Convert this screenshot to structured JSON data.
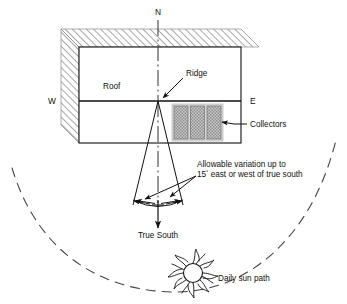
{
  "figure": {
    "labels": {
      "north": "N",
      "west": "W",
      "east": "E",
      "roof": "Roof",
      "ridge": "Ridge",
      "collectors": "Collectors",
      "true_south": "True South",
      "daily_sun_path": "Daily sun path",
      "variation_line1": "Allowable variation up to",
      "variation_line2_value": "15",
      "variation_line2_degree": "°",
      "variation_line2_rest": " east or west of true south"
    },
    "colors": {
      "ink": "#111111",
      "hatch": "#8a8a8a",
      "collector_fill": "#a8a8a8",
      "collector_border": "#d8d8d8",
      "background": "#ffffff"
    },
    "geometry": {
      "allowable_variation_degrees": 15,
      "variation_direction": "east or west of true south",
      "collector_panel_count": 3
    }
  }
}
